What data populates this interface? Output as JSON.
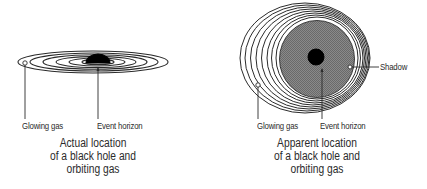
{
  "left_panel": {
    "labels": {
      "glowing_gas": "Glowing gas",
      "event_horizon": "Event horizon"
    },
    "caption": {
      "line1": "Actual location",
      "line2": "of a black hole and",
      "line3": "orbiting gas"
    }
  },
  "right_panel": {
    "labels": {
      "glowing_gas": "Glowing gas",
      "event_horizon": "Event horizon",
      "shadow": "Shadow"
    },
    "caption": {
      "line1": "Apparent location",
      "line2": "of a black hole and",
      "line3": "orbiting gas"
    }
  },
  "colors": {
    "line": "#2b2b2b",
    "shadow_fill": "#7a7a7a",
    "black_hole": "#000000"
  }
}
